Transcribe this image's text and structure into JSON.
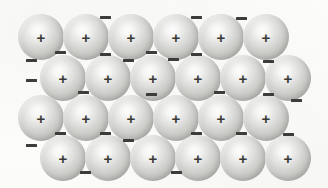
{
  "figure": {
    "background_color": "#fdfdfc",
    "width": 328,
    "height": 188
  },
  "legend": {
    "positive_ion_symbol": "+",
    "positive_ion_label": "positive metal ion",
    "electron_symbol": "–",
    "electron_label": "delocalised electron"
  },
  "colors": {
    "sphere_highlight": "#fdfdfd",
    "sphere_midtone": "#d6d6d3",
    "sphere_edge": "#b2b2ae",
    "symbol_color": "#3a3a38",
    "electron_color": "#3c3c3a",
    "background": "#fdfdfc"
  },
  "chart_data": {
    "type": "scatter",
    "xlabel": "",
    "ylabel": "",
    "xlim": [
      0,
      328
    ],
    "ylim": [
      0,
      188
    ],
    "grid": false,
    "legend_position": "none",
    "series": [
      {
        "name": "positive metal ions",
        "marker": "sphere",
        "symbol": "+",
        "count": 24,
        "radius": 23,
        "rows": 4,
        "columns": 6,
        "row_offset": 22,
        "points": [
          {
            "x": 41,
            "y": 37,
            "label": "+"
          },
          {
            "x": 86,
            "y": 37,
            "label": "+"
          },
          {
            "x": 131,
            "y": 37,
            "label": "+"
          },
          {
            "x": 176,
            "y": 37,
            "label": "+"
          },
          {
            "x": 221,
            "y": 37,
            "label": "+"
          },
          {
            "x": 266,
            "y": 37,
            "label": "+"
          },
          {
            "x": 63,
            "y": 78,
            "label": "+"
          },
          {
            "x": 108,
            "y": 78,
            "label": "+"
          },
          {
            "x": 153,
            "y": 78,
            "label": "+"
          },
          {
            "x": 198,
            "y": 78,
            "label": "+"
          },
          {
            "x": 243,
            "y": 78,
            "label": "+"
          },
          {
            "x": 288,
            "y": 78,
            "label": "+"
          },
          {
            "x": 41,
            "y": 118,
            "label": "+"
          },
          {
            "x": 86,
            "y": 118,
            "label": "+"
          },
          {
            "x": 131,
            "y": 118,
            "label": "+"
          },
          {
            "x": 176,
            "y": 118,
            "label": "+"
          },
          {
            "x": 221,
            "y": 118,
            "label": "+"
          },
          {
            "x": 266,
            "y": 118,
            "label": "+"
          },
          {
            "x": 63,
            "y": 158,
            "label": "+"
          },
          {
            "x": 108,
            "y": 158,
            "label": "+"
          },
          {
            "x": 153,
            "y": 158,
            "label": "+"
          },
          {
            "x": 198,
            "y": 158,
            "label": "+"
          },
          {
            "x": 243,
            "y": 158,
            "label": "+"
          },
          {
            "x": 288,
            "y": 158,
            "label": "+"
          }
        ]
      },
      {
        "name": "delocalised electrons",
        "marker": "minus-bar",
        "symbol": "–",
        "count": 24,
        "points": [
          {
            "x": 105,
            "y": 17,
            "label": "–"
          },
          {
            "x": 196,
            "y": 17,
            "label": "–"
          },
          {
            "x": 241,
            "y": 18,
            "label": "–"
          },
          {
            "x": 60,
            "y": 52,
            "label": "–"
          },
          {
            "x": 105,
            "y": 54,
            "label": "–"
          },
          {
            "x": 128,
            "y": 60,
            "label": "–"
          },
          {
            "x": 151,
            "y": 52,
            "label": "–"
          },
          {
            "x": 173,
            "y": 59,
            "label": "–"
          },
          {
            "x": 196,
            "y": 54,
            "label": "–"
          },
          {
            "x": 268,
            "y": 61,
            "label": "–"
          },
          {
            "x": 31,
            "y": 60,
            "label": "–"
          },
          {
            "x": 31,
            "y": 80,
            "label": "–"
          },
          {
            "x": 83,
            "y": 92,
            "label": "–"
          },
          {
            "x": 151,
            "y": 94,
            "label": "–"
          },
          {
            "x": 219,
            "y": 92,
            "label": "–"
          },
          {
            "x": 268,
            "y": 94,
            "label": "–"
          },
          {
            "x": 296,
            "y": 100,
            "label": "–"
          },
          {
            "x": 60,
            "y": 133,
            "label": "–"
          },
          {
            "x": 105,
            "y": 133,
            "label": "–"
          },
          {
            "x": 128,
            "y": 140,
            "label": "–"
          },
          {
            "x": 196,
            "y": 133,
            "label": "–"
          },
          {
            "x": 241,
            "y": 133,
            "label": "–"
          },
          {
            "x": 288,
            "y": 134,
            "label": "–"
          },
          {
            "x": 31,
            "y": 145,
            "label": "–"
          },
          {
            "x": 85,
            "y": 172,
            "label": "–"
          },
          {
            "x": 176,
            "y": 172,
            "label": "–"
          }
        ]
      }
    ]
  }
}
